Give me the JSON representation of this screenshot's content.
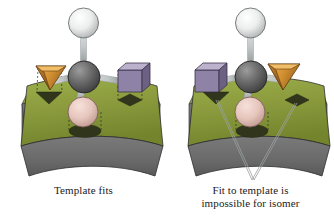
{
  "figure": {
    "background_color": "#ffffff",
    "width": 334,
    "height": 216
  },
  "palette": {
    "slab_top": "#8a9a3c",
    "slab_top_light": "#a3b14f",
    "slab_top_dark": "#6f7d2c",
    "slab_side": "#6e6e6e",
    "slab_side_dark": "#5a5a5a",
    "hole_fill": "#33371d",
    "central_atom": "#6d6d6d",
    "central_atom_dark": "#4a4a4a",
    "white_atom": "#ededed",
    "white_atom_shadow": "#bdbdbd",
    "pink_atom": "#e8c9c2",
    "pink_atom_shadow": "#c99f96",
    "bond": "#bfc4c4",
    "bond_dark": "#8e9494",
    "cone_light": "#e8a23c",
    "cone_mid": "#c9832a",
    "cone_dark": "#9a6320",
    "cube_light": "#b9aecb",
    "cube_mid": "#8e82a6",
    "cube_dark": "#6d6183",
    "outline": "#2b2b2b",
    "leader_line": "#9aa0a0",
    "dashed_guide": "#2b2b2b",
    "caption_text": "#1a1a1a"
  },
  "panels": [
    {
      "id": "left",
      "caption_lines": [
        "Template fits"
      ],
      "fits": true,
      "substituents": {
        "top_sphere": "white-hydrogen-atom",
        "bottom_sphere": "pink-atom",
        "left_shape": "orange-cone",
        "right_shape": "purple-cube"
      },
      "template_holes": [
        "triangle-hole-left",
        "ellipse-hole-center",
        "diamond-hole-right"
      ],
      "has_leader_lines": false
    },
    {
      "id": "right",
      "caption_lines": [
        "Fit to template is",
        "impossible for isomer"
      ],
      "fits": false,
      "substituents": {
        "top_sphere": "white-hydrogen-atom",
        "bottom_sphere": "pink-atom",
        "left_shape": "purple-cube",
        "right_shape": "orange-cone"
      },
      "template_holes": [
        "triangle-hole-left",
        "ellipse-hole-center",
        "diamond-hole-right"
      ],
      "has_leader_lines": true
    }
  ]
}
